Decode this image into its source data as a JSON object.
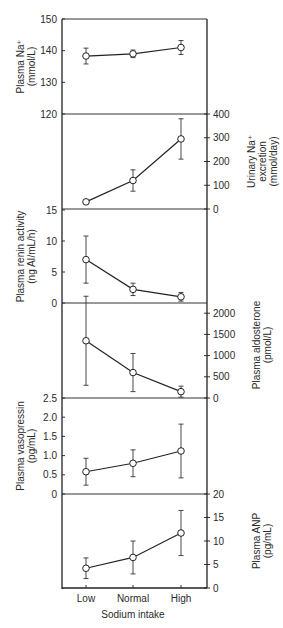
{
  "chart_data": {
    "type": "line",
    "title": "",
    "xlabel": "Sodium intake",
    "categories": [
      "Low",
      "Normal",
      "High"
    ],
    "layout": {
      "x_positions": [
        86,
        133,
        181
      ],
      "plot_left": 62,
      "plot_right": 207,
      "grid": false,
      "legend": "none"
    },
    "panels": [
      {
        "name": "plasma-na",
        "label_lines": [
          "Plasma Na⁺",
          "(mmol/L)"
        ],
        "axis_side": "left",
        "ylim": [
          120,
          150
        ],
        "y_px": [
          114,
          19
        ],
        "ticks": [
          120,
          130,
          140,
          150
        ],
        "values": [
          138.3,
          139.0,
          141.0
        ],
        "err": [
          2.5,
          1.2,
          2.2
        ],
        "label_x": 26
      },
      {
        "name": "urinary-na",
        "label_lines": [
          "Urinary Na⁺",
          "excretion",
          "(mmol/day)"
        ],
        "axis_side": "right",
        "ylim": [
          0,
          400
        ],
        "y_px": [
          209,
          114
        ],
        "ticks": [
          0,
          100,
          200,
          300,
          400
        ],
        "values": [
          30,
          120,
          295
        ],
        "err": [
          0,
          45,
          85
        ],
        "label_x": 262
      },
      {
        "name": "plasma-renin-activity",
        "label_lines": [
          "Plasma renin activity",
          "(ng AI/mL/h)"
        ],
        "axis_side": "left",
        "ylim": [
          0,
          15
        ],
        "y_px": [
          303,
          210
        ],
        "ticks": [
          0,
          5,
          10,
          15
        ],
        "values": [
          7.0,
          2.2,
          1.0
        ],
        "err": [
          3.8,
          1.0,
          0.7
        ],
        "label_x": 26
      },
      {
        "name": "plasma-aldosterone",
        "label_lines": [
          "Plasma aldosterone",
          "(pmol/L)"
        ],
        "axis_side": "right",
        "ylim": [
          0,
          2500
        ],
        "y_px": [
          398,
          292
        ],
        "ticks": [
          0,
          500,
          1000,
          1500,
          2000
        ],
        "values": [
          1350,
          600,
          150
        ],
        "err": [
          1050,
          450,
          130
        ],
        "label_x": 262
      },
      {
        "name": "plasma-vasopressin",
        "label_lines": [
          "Plasma vasopressin",
          "(pg/mL)"
        ],
        "axis_side": "left",
        "ylim": [
          0,
          2.5
        ],
        "y_px": [
          494,
          398
        ],
        "ticks": [
          0,
          0.5,
          1.0,
          1.5,
          2.0,
          2.5
        ],
        "tick_labels": [
          "0",
          "0.5",
          "1.0",
          "1.5",
          "2.0",
          "2.5"
        ],
        "values": [
          0.58,
          0.8,
          1.12
        ],
        "err": [
          0.35,
          0.35,
          0.7
        ],
        "label_x": 26
      },
      {
        "name": "plasma-anp",
        "label_lines": [
          "Plasma ANP",
          "(pg/mL)"
        ],
        "axis_side": "right",
        "ylim": [
          0,
          20
        ],
        "y_px": [
          588,
          494
        ],
        "ticks": [
          0,
          5,
          10,
          15,
          20
        ],
        "values": [
          4.2,
          6.5,
          11.7
        ],
        "err": [
          2.2,
          3.5,
          4.8
        ],
        "label_x": 262
      }
    ]
  }
}
